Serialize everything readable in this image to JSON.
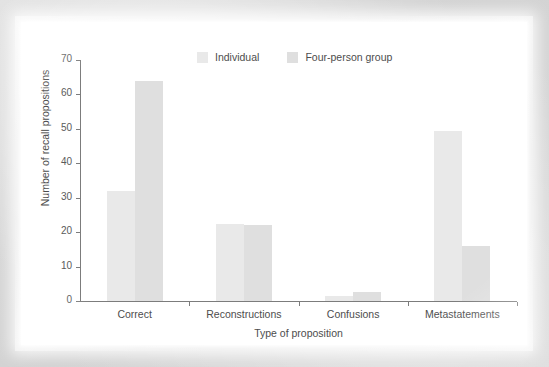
{
  "figure": {
    "panel_background": "#ffffff",
    "page_background": "#d7d7d7"
  },
  "chart_data": {
    "type": "bar",
    "title": "",
    "subtitle": "",
    "xlabel": "Type of proposition",
    "ylabel": "Number of recall propositions",
    "categories": [
      "Correct",
      "Reconstructions",
      "Confusions",
      "Metastatements"
    ],
    "series": [
      {
        "name": "Individual",
        "color": "#e9e9e9",
        "values": [
          32,
          22.5,
          1.5,
          49.5
        ]
      },
      {
        "name": "Four-person group",
        "color": "#dfdfdf",
        "values": [
          64,
          22,
          2.5,
          16
        ]
      }
    ],
    "ylim": [
      0,
      70
    ],
    "yticks": [
      0,
      10,
      20,
      30,
      40,
      50,
      60,
      70
    ],
    "ytick_labels": [
      "0",
      "10",
      "20",
      "30",
      "40",
      "50",
      "60",
      "70"
    ],
    "grid": false,
    "legend_position": "top-center",
    "legend_entries": [
      "Individual",
      "Four-person group"
    ],
    "annotations": []
  }
}
